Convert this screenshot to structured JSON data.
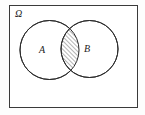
{
  "figure": {
    "type": "venn-diagram",
    "background_color": "#fdfdfd"
  },
  "universe": {
    "label": "Ω",
    "label_name": "omega-universe-label",
    "border_color": "#3a3a3a",
    "fill_color": "#ffffff",
    "rect": {
      "x": 9,
      "y": 5,
      "width": 129,
      "height": 103
    },
    "label_pos": {
      "x": 15,
      "y": 17
    },
    "label_font_size": 10
  },
  "sets": [
    {
      "id": "A",
      "label": "A",
      "label_name": "set-a-label",
      "circle": {
        "cx": 49.5,
        "cy": 50,
        "r": 29.5
      },
      "label_pos": {
        "x": 42,
        "y": 53
      },
      "stroke_color": "#2b2b2b",
      "fill_color": "#ffffff",
      "label_font_size": 10
    },
    {
      "id": "B",
      "label": "B",
      "label_name": "set-b-label",
      "circle": {
        "cx": 89.5,
        "cy": 49,
        "r": 28.5
      },
      "label_pos": {
        "x": 87,
        "y": 52
      },
      "stroke_color": "#2b2b2b",
      "fill_color": "#ffffff",
      "label_font_size": 10
    }
  ],
  "intersection": {
    "name": "a-intersect-b-region",
    "description": "hatched lens region where A and B overlap",
    "hatch_direction": "forward-slash",
    "hatch_spacing": 3,
    "hatch_color": "#2b2b2b",
    "hatch_width": 0.7
  },
  "stroke": {
    "circle_width": 1,
    "frame_width": 1
  },
  "chart_data": {
    "type": "venn",
    "universe_label": "Ω",
    "sets": [
      "A",
      "B"
    ],
    "shaded_regions": [
      "A∩B"
    ],
    "set_geometry": [
      {
        "set": "A",
        "cx": 49.5,
        "cy": 50,
        "r": 29.5
      },
      {
        "set": "B",
        "cx": 89.5,
        "cy": 49,
        "r": 28.5
      }
    ],
    "labels": [
      "Ω",
      "A",
      "B"
    ],
    "legend": "none",
    "grid": false
  }
}
